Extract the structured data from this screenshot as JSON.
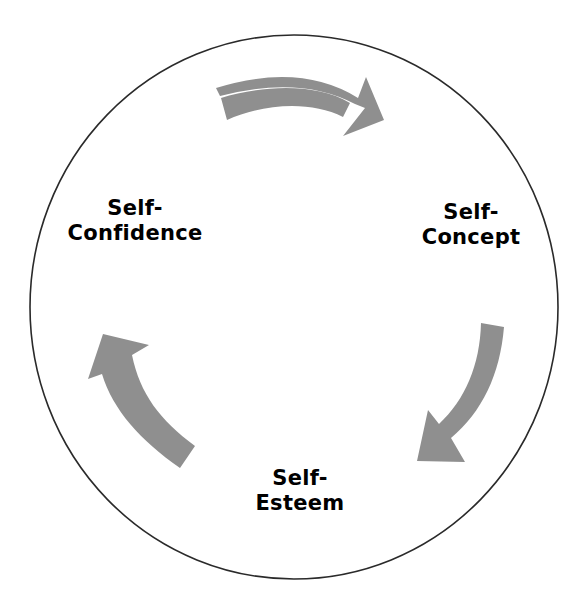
{
  "diagram": {
    "type": "cycle",
    "colors": {
      "background": "#ffffff",
      "circle_stroke": "#2a2a2a",
      "arrow_fill": "#8f8f8f",
      "text": "#000000"
    },
    "nodes": [
      {
        "id": "self-concept",
        "line1": "Self-",
        "line2": "Concept"
      },
      {
        "id": "self-esteem",
        "line1": "Self-",
        "line2": "Esteem"
      },
      {
        "id": "self-confidence",
        "line1": "Self-",
        "line2": "Confidence"
      }
    ],
    "arrows": [
      {
        "from": "self-confidence",
        "to": "self-concept",
        "direction": "clockwise"
      },
      {
        "from": "self-concept",
        "to": "self-esteem",
        "direction": "clockwise"
      },
      {
        "from": "self-esteem",
        "to": "self-confidence",
        "direction": "clockwise"
      }
    ]
  }
}
